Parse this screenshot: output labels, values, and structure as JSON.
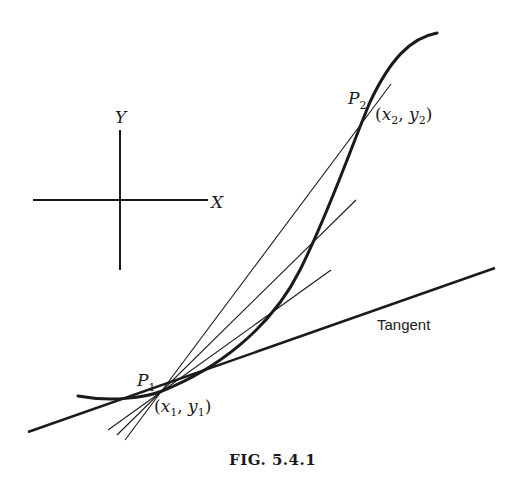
{
  "figure": {
    "caption": "Fig. 5.4.1",
    "caption_display": "FIG. 5.4.1"
  },
  "axes_inset": {
    "x_label": "X",
    "y_label": "Y"
  },
  "points": {
    "p1": {
      "name": "P",
      "sub": "1",
      "coords_label": "(x1, y1)",
      "x_sym": "x",
      "y_sym": "y"
    },
    "p2": {
      "name": "P",
      "sub": "2",
      "coords_label": "(x2, y2)",
      "x_sym": "x",
      "y_sym": "y"
    }
  },
  "labels": {
    "tangent": "Tangent"
  },
  "colors": {
    "ink": "#1a1a1a",
    "background": "#ffffff"
  }
}
